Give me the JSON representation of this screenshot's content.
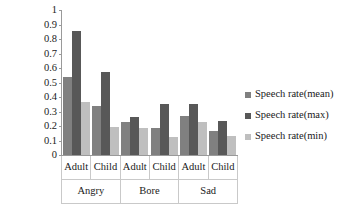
{
  "chart_data": {
    "type": "bar",
    "title": "",
    "xlabel": "",
    "ylabel": "",
    "ylim": [
      0,
      1
    ],
    "ytick_labels": [
      "1",
      "0.9",
      "0.8",
      "0.7",
      "0.6",
      "0.5",
      "0.4",
      "0.3",
      "0.2",
      "0.1",
      "0"
    ],
    "ytick_values": [
      1,
      0.9,
      0.8,
      0.7,
      0.6,
      0.5,
      0.4,
      0.3,
      0.2,
      0.1,
      0
    ],
    "grid": false,
    "legend_position": "right",
    "groups": [
      "Angry",
      "Bore",
      "Sad"
    ],
    "subcategories": [
      "Adult",
      "Child"
    ],
    "categories": [
      "Angry / Adult",
      "Angry / Child",
      "Bore / Adult",
      "Bore / Child",
      "Sad / Adult",
      "Sad / Child"
    ],
    "series": [
      {
        "name": "Speech rate(mean)",
        "color": "#808080",
        "values": [
          0.535,
          0.335,
          0.225,
          0.185,
          0.27,
          0.165
        ]
      },
      {
        "name": "Speech rate(max)",
        "color": "#585858",
        "values": [
          0.855,
          0.575,
          0.265,
          0.355,
          0.355,
          0.235
        ]
      },
      {
        "name": "Speech rate(min)",
        "color": "#bfbfbf",
        "values": [
          0.365,
          0.195,
          0.185,
          0.125,
          0.23,
          0.13
        ]
      }
    ]
  },
  "axis": {
    "ticks": [
      {
        "label": "1",
        "value": 1
      },
      {
        "label": "0.9",
        "value": 0.9
      },
      {
        "label": "0.8",
        "value": 0.8
      },
      {
        "label": "0.7",
        "value": 0.7
      },
      {
        "label": "0.6",
        "value": 0.6
      },
      {
        "label": "0.5",
        "value": 0.5
      },
      {
        "label": "0.4",
        "value": 0.4
      },
      {
        "label": "0.3",
        "value": 0.3
      },
      {
        "label": "0.2",
        "value": 0.2
      },
      {
        "label": "0.1",
        "value": 0.1
      },
      {
        "label": "0",
        "value": 0
      }
    ]
  },
  "category_axis": {
    "leaf_labels": [
      "Adult",
      "Child",
      "Adult",
      "Child",
      "Adult",
      "Child"
    ],
    "group_labels": [
      "Angry",
      "Bore",
      "Sad"
    ]
  },
  "legend": {
    "items": [
      {
        "label": "Speech rate(mean)",
        "swatch": "s-mean"
      },
      {
        "label": "Speech rate(max)",
        "swatch": "s-max"
      },
      {
        "label": "Speech rate(min)",
        "swatch": "s-min"
      }
    ]
  }
}
